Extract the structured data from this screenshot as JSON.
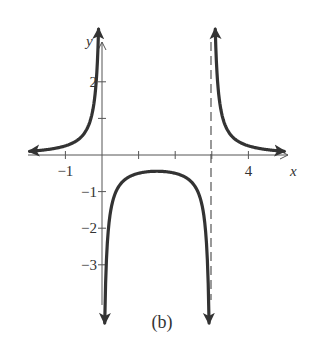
{
  "chart_data": {
    "type": "line",
    "title": "",
    "caption": "(b)",
    "xlabel": "x",
    "ylabel": "y",
    "function": "f(x) = 1 / (x(x - 3))",
    "xlim": [
      -2,
      5
    ],
    "ylim": [
      -4,
      3
    ],
    "grid": false,
    "x_tick_labels": [
      {
        "value": -1,
        "label": "−1"
      },
      {
        "value": 4,
        "label": "4"
      }
    ],
    "x_ticks": [
      -1,
      1,
      2,
      3,
      4
    ],
    "y_tick_labels": [
      {
        "value": 2,
        "label": "2"
      },
      {
        "value": -1,
        "label": "−1"
      },
      {
        "value": -2,
        "label": "−2"
      },
      {
        "value": -3,
        "label": "−3"
      }
    ],
    "y_ticks": [
      2,
      1,
      -1,
      -2,
      -3
    ],
    "asymptotes": {
      "vertical": [
        0,
        3
      ],
      "horizontal": [
        0
      ],
      "dashed_line_x": 3
    },
    "series": [
      {
        "name": "left-branch",
        "x": [
          -1.95,
          -1.5,
          -1,
          -0.5,
          -0.3,
          -0.2,
          -0.12,
          -0.1
        ],
        "y": [
          0.1,
          0.15,
          0.25,
          0.57,
          1.01,
          1.56,
          2.66,
          3.2
        ]
      },
      {
        "name": "middle-branch",
        "x": [
          0.09,
          0.15,
          0.3,
          0.5,
          1,
          1.5,
          2,
          2.5,
          2.7,
          2.85,
          2.91
        ],
        "y": [
          -3.8,
          -2.34,
          -1.23,
          -0.8,
          -0.5,
          -0.44,
          -0.5,
          -0.8,
          -1.23,
          -2.34,
          -3.8
        ]
      },
      {
        "name": "right-branch",
        "x": [
          3.1,
          3.12,
          3.2,
          3.3,
          3.5,
          4,
          4.5,
          5.0
        ],
        "y": [
          3.2,
          2.66,
          1.56,
          1.01,
          0.57,
          0.25,
          0.15,
          0.1
        ]
      }
    ]
  }
}
